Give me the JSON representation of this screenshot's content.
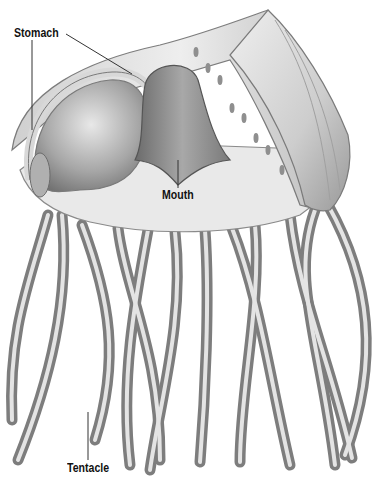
{
  "figure": {
    "style": "grayscale pencil illustration",
    "labels": {
      "stomach": "Stomach",
      "mouth": "Mouth",
      "tentacle": "Tentacle"
    },
    "colors": {
      "background": "#ffffff",
      "label_text": "#111111",
      "leader_line": "#333333",
      "body_light": "#e6e6e6",
      "body_mid": "#b5b5b5",
      "body_dark": "#6e6e6e"
    }
  }
}
